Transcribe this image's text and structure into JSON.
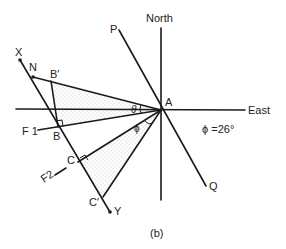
{
  "figure": {
    "caption": "(b)",
    "angle_annotation": "ϕ =26°",
    "labels": {
      "north": "North",
      "east": "East",
      "P": "P",
      "Q": "Q",
      "A": "A",
      "X": "X",
      "Y": "Y",
      "N": "N",
      "B_prime": "B′",
      "B": "B",
      "C": "C",
      "C_prime": "C′",
      "F1": "F 1",
      "F2": "F2",
      "theta": "θ",
      "phi": "ϕ"
    },
    "colors": {
      "line": "#1a1a1a",
      "stipple": "#888888"
    }
  }
}
